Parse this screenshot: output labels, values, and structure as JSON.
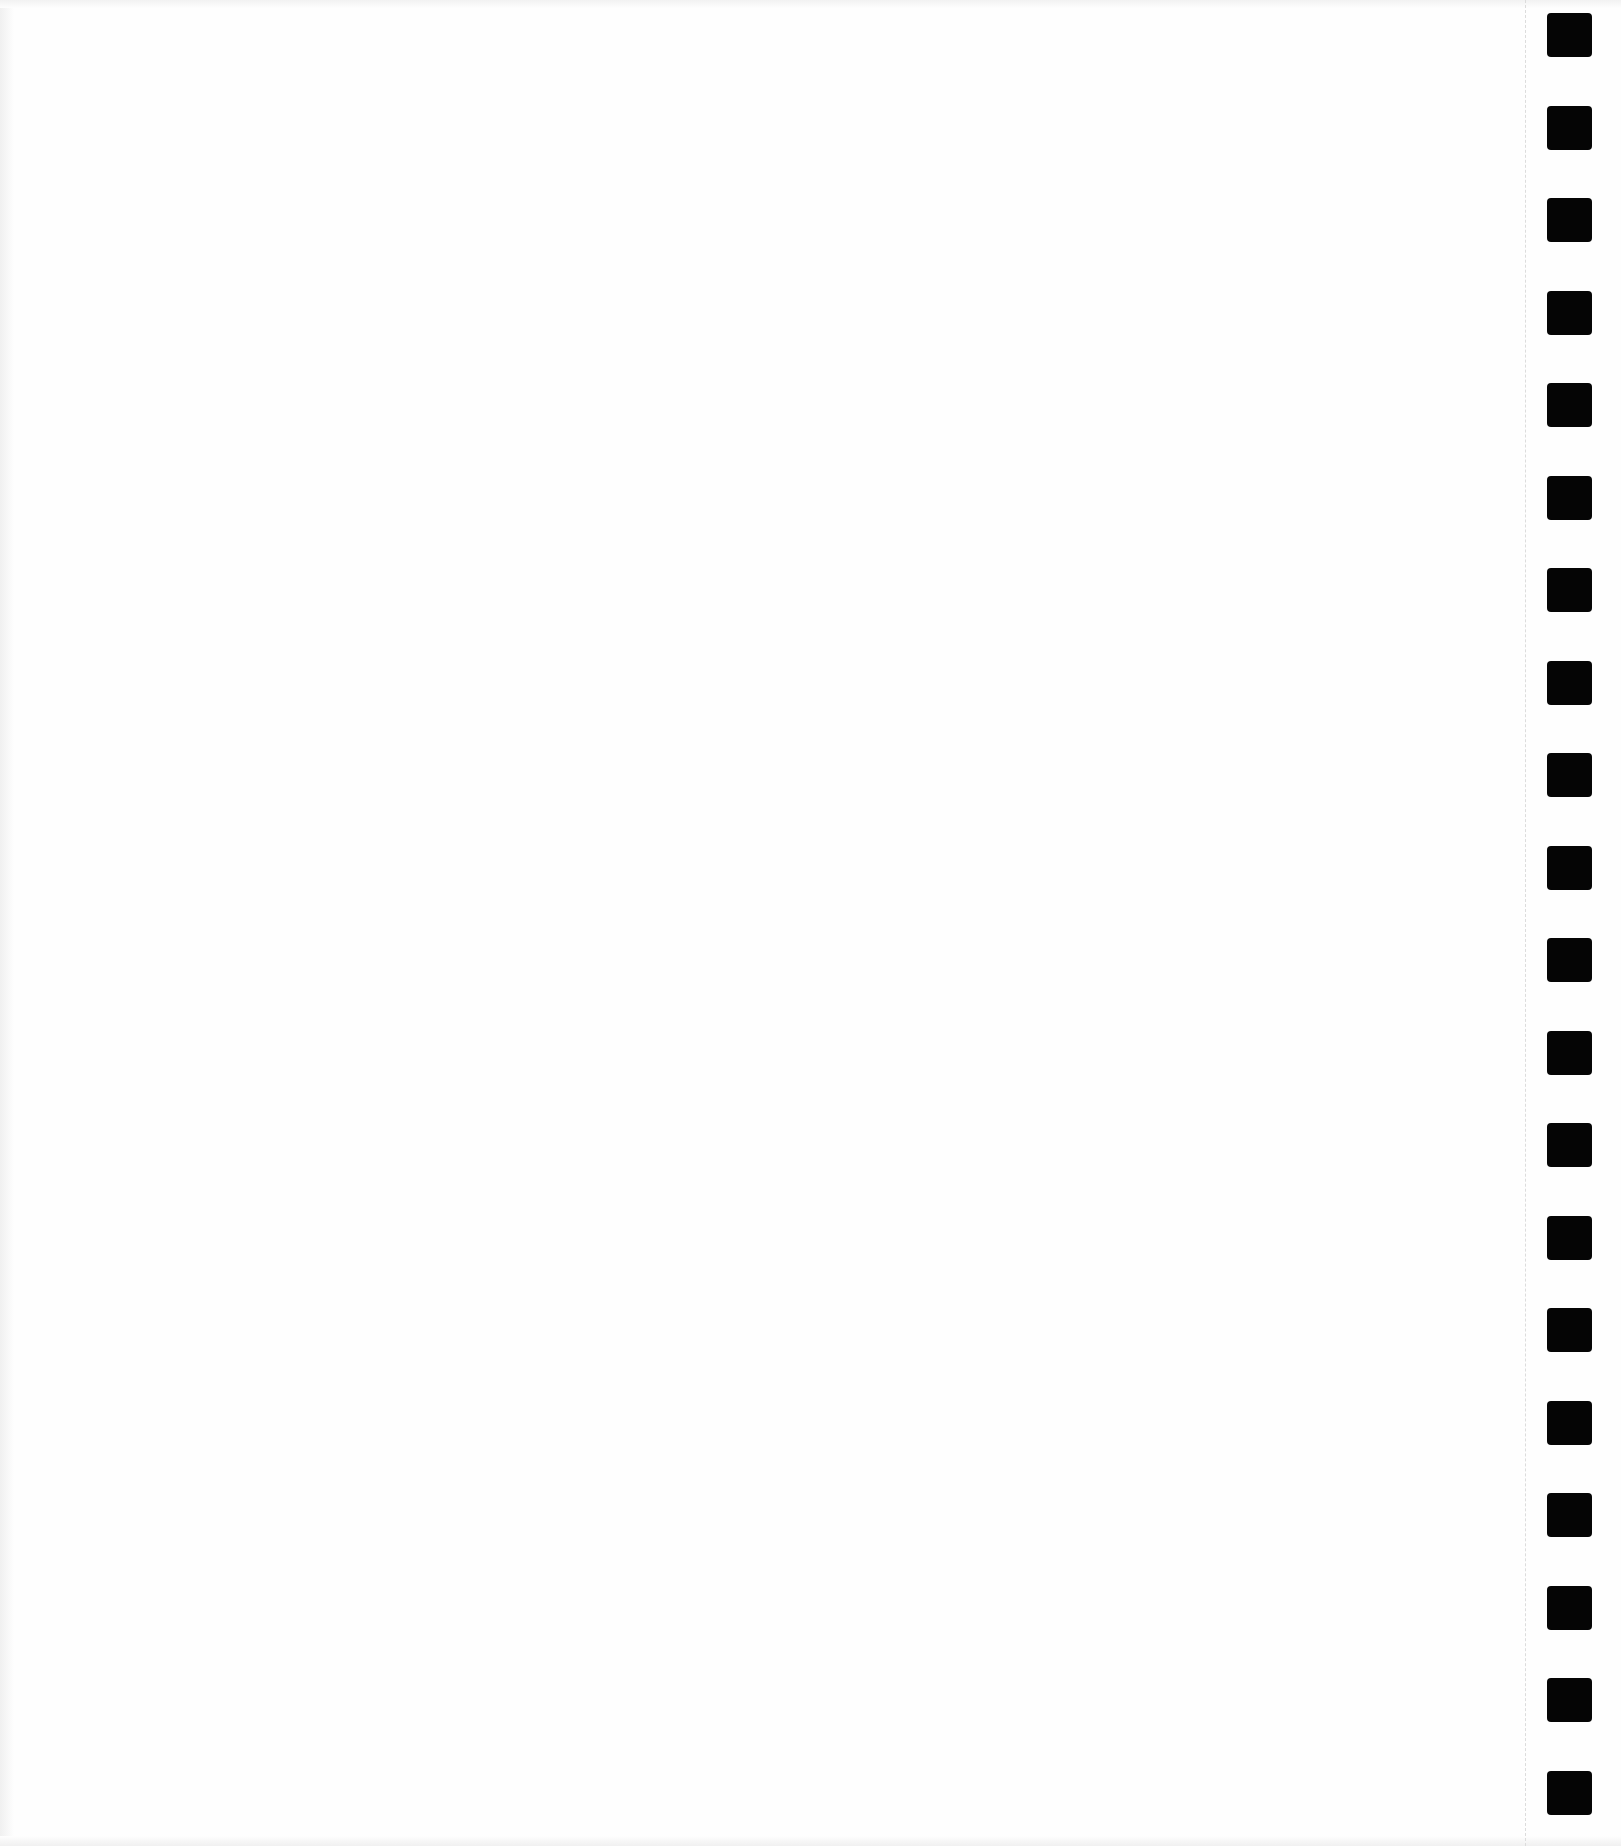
{
  "page": {
    "type": "blank continuous-feed paper sheet",
    "background_color": "#fefefe",
    "text_content": ""
  },
  "feed_holes": {
    "count": 20,
    "color": "#050505",
    "size_px": [
      45,
      44
    ],
    "x_px": 1547,
    "first_y_px": 13,
    "spacing_px": 92.5
  },
  "perforation": {
    "x_px": 1525,
    "color": "#dcdcdc",
    "style": "dashed"
  }
}
